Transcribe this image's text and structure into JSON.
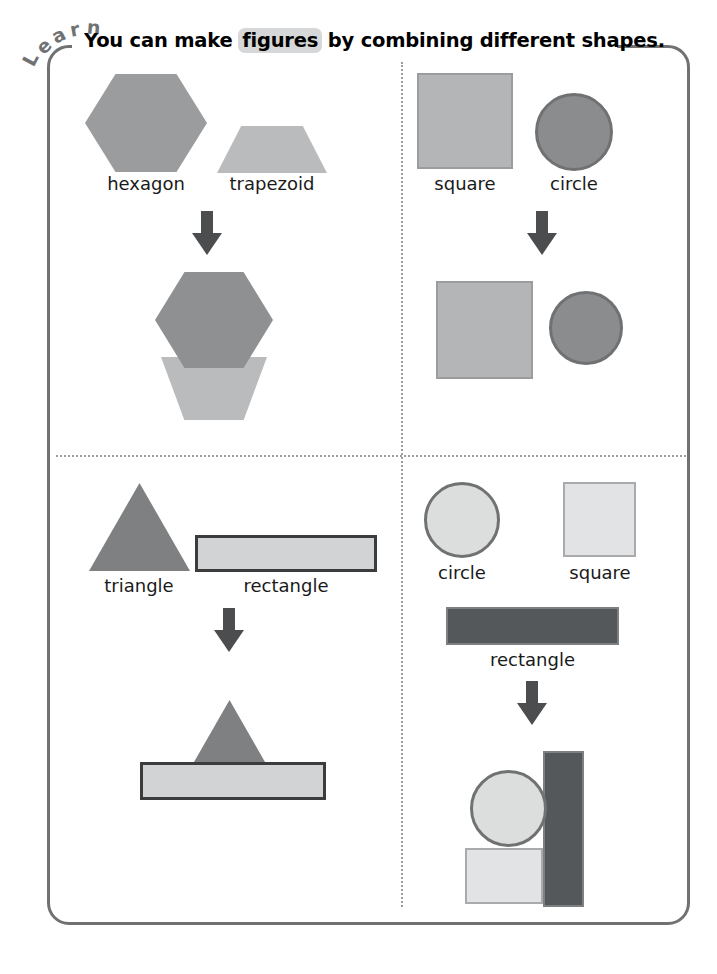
{
  "page": {
    "tab_label": "Learn",
    "tab_letters": [
      "L",
      "e",
      "a",
      "r",
      "n"
    ],
    "title_parts": {
      "before": "You can make ",
      "highlight": "figures",
      "after": " by combining different shapes."
    },
    "frame_color": "#6f7173",
    "divider_color": "#9a9c9e",
    "highlight_color": "#d6d7d8",
    "arrow_color": "#4b4d4f"
  },
  "quadrants": [
    {
      "id": "top-left",
      "source_shapes": [
        {
          "name": "hexagon",
          "label": "hexagon",
          "fill": "#9a9c9e"
        },
        {
          "name": "trapezoid",
          "label": "trapezoid",
          "fill": "#b9bbbd"
        }
      ],
      "arrow": "down-arrow",
      "result": {
        "name": "hexagon-trapezoid-figure",
        "parts": [
          "hexagon",
          "trapezoid-inverted"
        ]
      }
    },
    {
      "id": "top-right",
      "source_shapes": [
        {
          "name": "square",
          "label": "square",
          "fill": "#b3b5b7"
        },
        {
          "name": "circle",
          "label": "circle",
          "fill": "#8a8c8e"
        }
      ],
      "arrow": "down-arrow",
      "result": {
        "name": "square-circle-figure",
        "parts": [
          "square",
          "circle"
        ]
      }
    },
    {
      "id": "bottom-left",
      "source_shapes": [
        {
          "name": "triangle",
          "label": "triangle",
          "fill": "#7e8082"
        },
        {
          "name": "rectangle",
          "label": "rectangle",
          "fill": "#d2d3d4"
        }
      ],
      "arrow": "down-arrow",
      "result": {
        "name": "triangle-rectangle-figure",
        "parts": [
          "triangle",
          "rectangle"
        ]
      }
    },
    {
      "id": "bottom-right",
      "source_shapes": [
        {
          "name": "circle",
          "label": "circle",
          "fill": "#dcdddd"
        },
        {
          "name": "square",
          "label": "square",
          "fill": "#e2e3e4"
        },
        {
          "name": "rectangle",
          "label": "rectangle",
          "fill": "#55585a"
        }
      ],
      "arrow": "down-arrow",
      "result": {
        "name": "circle-square-rectangle-figure",
        "parts": [
          "circle",
          "square",
          "rectangle-vertical"
        ]
      }
    }
  ]
}
